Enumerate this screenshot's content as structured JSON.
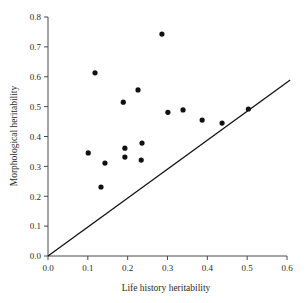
{
  "chart_data": {
    "type": "scatter",
    "title": "",
    "xlabel": "Life history heritability",
    "ylabel": "Morphological heritability",
    "xlim": [
      0.0,
      0.6
    ],
    "ylim": [
      0.0,
      0.8
    ],
    "xticks": [
      "0.0",
      "0.1",
      "0.2",
      "0.3",
      "0.4",
      "0.5",
      "0.6"
    ],
    "xtick_values": [
      0.0,
      0.1,
      0.2,
      0.3,
      0.4,
      0.5,
      0.6
    ],
    "yticks": [
      "0.0",
      "0.1",
      "0.2",
      "0.3",
      "0.4",
      "0.5",
      "0.6",
      "0.7",
      "0.8"
    ],
    "ytick_values": [
      0.0,
      0.1,
      0.2,
      0.3,
      0.4,
      0.5,
      0.6,
      0.7,
      0.8
    ],
    "grid": false,
    "legend": false,
    "legend_position": "none",
    "marker": "filled-circle",
    "marker_color": "#111111",
    "points": [
      {
        "x": 0.286,
        "y": 0.743
      },
      {
        "x": 0.118,
        "y": 0.613
      },
      {
        "x": 0.226,
        "y": 0.556
      },
      {
        "x": 0.189,
        "y": 0.515
      },
      {
        "x": 0.301,
        "y": 0.481
      },
      {
        "x": 0.339,
        "y": 0.489
      },
      {
        "x": 0.387,
        "y": 0.455
      },
      {
        "x": 0.437,
        "y": 0.445
      },
      {
        "x": 0.503,
        "y": 0.492
      },
      {
        "x": 0.236,
        "y": 0.378
      },
      {
        "x": 0.193,
        "y": 0.361
      },
      {
        "x": 0.193,
        "y": 0.331
      },
      {
        "x": 0.234,
        "y": 0.321
      },
      {
        "x": 0.101,
        "y": 0.345
      },
      {
        "x": 0.143,
        "y": 0.311
      },
      {
        "x": 0.133,
        "y": 0.231
      }
    ],
    "reference_line": {
      "label": "1:1 identity line",
      "x0": 0.0,
      "y0": 0.0,
      "x1": 0.608,
      "y1": 0.589
    }
  }
}
